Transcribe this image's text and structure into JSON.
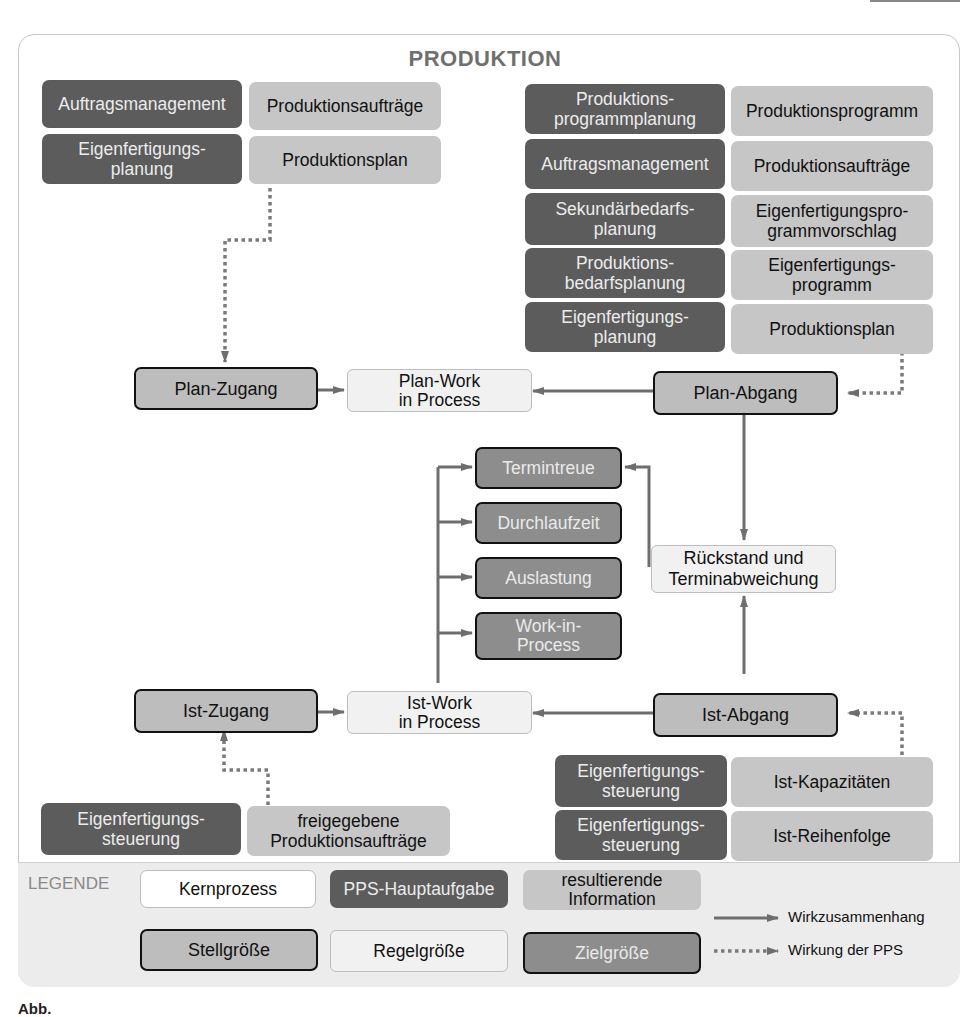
{
  "title": "PRODUKTION",
  "top_left": {
    "rows": [
      {
        "task": "Auftragsmanagement",
        "info": "Produktionsaufträge"
      },
      {
        "task": "Eigenfertigungs-\nplanung",
        "info": "Produktionsplan"
      }
    ]
  },
  "top_right": {
    "rows": [
      {
        "task": "Produktions-\nprogrammplanung",
        "info": "Produktionsprogramm"
      },
      {
        "task": "Auftragsmanagement",
        "info": "Produktionsaufträge"
      },
      {
        "task": "Sekundärbedarfs-\nplanung",
        "info": "Eigenfertigungspro-\ngrammvorschlag"
      },
      {
        "task": "Produktions-\nbedarfsplanung",
        "info": "Eigenfertigungs-\nprogramm"
      },
      {
        "task": "Eigenfertigungs-\nplanung",
        "info": "Produktionsplan"
      }
    ]
  },
  "plan": {
    "zugang": "Plan-Zugang",
    "wip": "Plan-Work\nin Process",
    "abgang": "Plan-Abgang"
  },
  "targets": [
    "Termintreue",
    "Durchlaufzeit",
    "Auslastung",
    "Work-in-\nProcess"
  ],
  "rueckstand": "Rückstand und\nTerminabweichung",
  "ist": {
    "zugang": "Ist-Zugang",
    "wip": "Ist-Work\nin Process",
    "abgang": "Ist-Abgang"
  },
  "bottom_left": {
    "rows": [
      {
        "task": "Eigenfertigungs-\nsteuerung",
        "info": "freigegebene\nProduktionsaufträge"
      }
    ]
  },
  "bottom_right": {
    "rows": [
      {
        "task": "Eigenfertigungs-\nsteuerung",
        "info": "Ist-Kapazitäten"
      },
      {
        "task": "Eigenfertigungs-\nsteuerung",
        "info": "Ist-Reihenfolge"
      }
    ]
  },
  "legend": {
    "title": "LEGENDE",
    "kernprozess": "Kernprozess",
    "pps_hauptaufgabe": "PPS-Hauptaufgabe",
    "resultierende_information": "resultierende\nInformation",
    "stellgroesse": "Stellgröße",
    "regelgroesse": "Regelgröße",
    "zielgroesse": "Zielgröße",
    "wirkzusammenhang": "Wirkzusammenhang",
    "wirkung_pps": "Wirkung der PPS"
  },
  "caption": "Abb."
}
